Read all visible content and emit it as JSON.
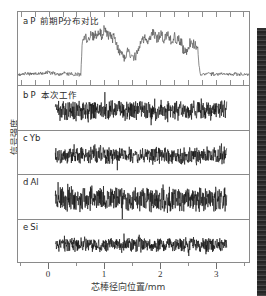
{
  "figure": {
    "y_axis_label": "信号强度",
    "x_axis_label": "芯棒径向位置/mm"
  },
  "panels": [
    {
      "letter": "a",
      "element": "P",
      "note": "前期P分布对比"
    },
    {
      "letter": "b",
      "element": "P",
      "note": "本次工作"
    },
    {
      "letter": "c",
      "element": "Yb",
      "note": ""
    },
    {
      "letter": "d",
      "element": "Al",
      "note": ""
    },
    {
      "letter": "e",
      "element": "Si",
      "note": ""
    }
  ],
  "x_ticks": [
    {
      "value": 0,
      "label": "0"
    },
    {
      "value": 1,
      "label": "1"
    },
    {
      "value": 2,
      "label": "2"
    },
    {
      "value": 3,
      "label": "3"
    }
  ],
  "chart_data": {
    "type": "line",
    "title": "",
    "xlabel": "芯棒径向位置/mm",
    "ylabel": "信号强度",
    "xlim": [
      -0.55,
      3.6
    ],
    "grid": false,
    "legend": "none",
    "tick_labels_x": [
      "0",
      "1",
      "2",
      "3"
    ],
    "minor_ticks_per_major": 2,
    "panel_layout": "5 stacked panels sharing one x-axis",
    "series": [
      {
        "name": "a P 前期P分布对比",
        "panel": "a",
        "description": "Baseline low noise outside core; step rise at x=0.60 to a high noisy plateau with a pronounced dip near x=1.25-1.60, recovery, second dip near x=2.45, sharp drop back to baseline at x=2.72",
        "baseline": 0.06,
        "plateau_mean": 0.72,
        "x": [
          -0.5,
          -0.4,
          -0.3,
          -0.2,
          -0.1,
          0.0,
          0.1,
          0.2,
          0.3,
          0.4,
          0.5,
          0.58,
          0.6,
          0.64,
          0.7,
          0.76,
          0.82,
          0.88,
          0.94,
          1.0,
          1.06,
          1.12,
          1.18,
          1.24,
          1.3,
          1.36,
          1.42,
          1.48,
          1.54,
          1.6,
          1.66,
          1.72,
          1.78,
          1.84,
          1.9,
          1.96,
          2.02,
          2.08,
          2.14,
          2.2,
          2.26,
          2.32,
          2.38,
          2.44,
          2.5,
          2.56,
          2.62,
          2.68,
          2.72,
          2.78,
          2.9,
          3.0,
          3.1,
          3.2,
          3.3,
          3.4,
          3.5
        ],
        "y": [
          0.05,
          0.07,
          0.05,
          0.09,
          0.06,
          0.1,
          0.06,
          0.05,
          0.08,
          0.06,
          0.05,
          0.06,
          0.62,
          0.8,
          0.66,
          0.84,
          0.78,
          0.88,
          0.82,
          0.9,
          0.86,
          0.8,
          0.74,
          0.58,
          0.46,
          0.4,
          0.52,
          0.44,
          0.38,
          0.5,
          0.68,
          0.78,
          0.72,
          0.86,
          0.8,
          0.74,
          0.82,
          0.76,
          0.84,
          0.7,
          0.78,
          0.72,
          0.66,
          0.48,
          0.56,
          0.7,
          0.62,
          0.56,
          0.08,
          0.06,
          0.07,
          0.05,
          0.08,
          0.06,
          0.05,
          0.07,
          0.05
        ]
      },
      {
        "name": "b P 本次工作",
        "panel": "b",
        "description": "Flat uniform high-frequency noise band across the core, 0.12-3.20 mm, constant mean level, no plateau structure",
        "x_start": 0.12,
        "x_end": 3.2,
        "mean": 0.5,
        "noise_amplitude": 0.16
      },
      {
        "name": "c Yb",
        "panel": "c",
        "description": "Flat uniform noise band across core, slightly lower amplitude than panel b",
        "x_start": 0.12,
        "x_end": 3.2,
        "mean": 0.5,
        "noise_amplitude": 0.14
      },
      {
        "name": "d Al",
        "panel": "d",
        "description": "Flat uniform noise band across core, largest noise amplitude of the lower four panels",
        "x_start": 0.12,
        "x_end": 3.2,
        "mean": 0.5,
        "noise_amplitude": 0.2
      },
      {
        "name": "e Si",
        "panel": "e",
        "description": "Flat uniform noise band across core, smallest noise amplitude",
        "x_start": 0.12,
        "x_end": 3.2,
        "mean": 0.5,
        "noise_amplitude": 0.11
      }
    ]
  }
}
